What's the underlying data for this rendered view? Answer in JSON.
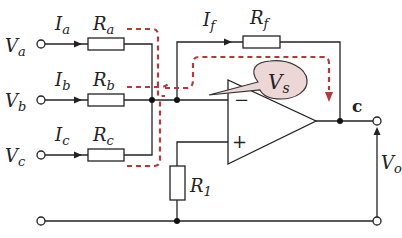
{
  "diagram": {
    "type": "inverting-summing-amplifier",
    "inputs": [
      {
        "voltage": "V",
        "voltage_sub": "a",
        "current": "I",
        "current_sub": "a",
        "resistor": "R",
        "resistor_sub": "a"
      },
      {
        "voltage": "V",
        "voltage_sub": "b",
        "current": "I",
        "current_sub": "b",
        "resistor": "R",
        "resistor_sub": "b"
      },
      {
        "voltage": "V",
        "voltage_sub": "c",
        "current": "I",
        "current_sub": "c",
        "resistor": "R",
        "resistor_sub": "c"
      }
    ],
    "feedback": {
      "current": "I",
      "current_sub": "f",
      "resistor": "R",
      "resistor_sub": "f"
    },
    "bias_resistor": {
      "label": "R",
      "sub": "1"
    },
    "opamp": {
      "inverting": "−",
      "noninverting": "+"
    },
    "callout": {
      "label": "V",
      "sub": "s"
    },
    "output_node": "c",
    "output_voltage": {
      "label": "V",
      "sub": "o"
    },
    "colors": {
      "wire": "#222222",
      "current_path": "#b23a3a",
      "callout_fill": "#ecd6d6"
    }
  }
}
